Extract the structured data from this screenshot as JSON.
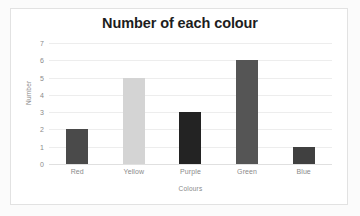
{
  "chart_data": {
    "type": "bar",
    "title": "Number of each colour",
    "xlabel": "Colours",
    "ylabel": "Number",
    "categories": [
      "Red",
      "Yellow",
      "Purple",
      "Green",
      "Blue"
    ],
    "values": [
      2,
      5,
      3,
      6,
      1
    ],
    "bar_colors": [
      "#4a4a4a",
      "#d4d4d4",
      "#232323",
      "#555555",
      "#404040"
    ],
    "ylim": [
      0,
      7
    ],
    "yticks": [
      7,
      6,
      5,
      4,
      3,
      2,
      1,
      0
    ],
    "grid": true,
    "legend": "none"
  },
  "style": {
    "frame_border_color": "#e2e2e2",
    "plot_background": "#ffffff",
    "page_background": "#fbfbfb",
    "gridline_color": "#ededed",
    "tick_label_color": "#8a8a8a",
    "title_color": "#1d1d1d"
  }
}
